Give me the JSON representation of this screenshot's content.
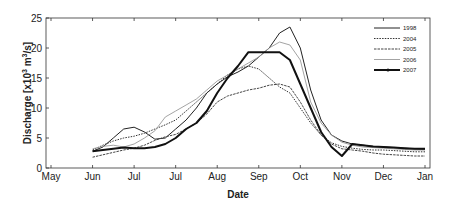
{
  "chart_data": {
    "type": "line",
    "title": "",
    "xlabel": "Date",
    "ylabel": "Discharge [x10^3 m^3/s]",
    "ylabel_parts": {
      "main": "Discharge [x10",
      "exp1": "3",
      "mid": " m",
      "exp2": "3",
      "end": "/s]"
    },
    "ylim": [
      0,
      25
    ],
    "yticks": [
      "0",
      "5",
      "10",
      "15",
      "20",
      "25"
    ],
    "xticks": [
      "May",
      "Jun",
      "Jul",
      "Jul",
      "Aug",
      "Sep",
      "Oct",
      "Nov",
      "Dec",
      "Jan"
    ],
    "grid": false,
    "legend_position": "upper right",
    "x": [
      0.0,
      0.25,
      0.5,
      0.75,
      1.0,
      1.25,
      1.5,
      1.75,
      2.0,
      2.25,
      2.5,
      2.75,
      3.0,
      3.25,
      3.5,
      3.75,
      4.0,
      4.25,
      4.5,
      4.75,
      5.0,
      5.25,
      5.5,
      5.75,
      6.0,
      6.25,
      6.5,
      6.75,
      7.0,
      7.25,
      7.5,
      7.75,
      8.0
    ],
    "series": [
      {
        "name": "1998",
        "style": "solid-thin",
        "values": [
          2.8,
          3.5,
          5.0,
          6.5,
          6.8,
          6.0,
          4.8,
          5.0,
          6.5,
          8.0,
          10.0,
          12.5,
          14.0,
          15.2,
          16.0,
          17.0,
          18.5,
          20.0,
          22.5,
          23.5,
          20.0,
          13.0,
          8.0,
          5.5,
          4.5,
          4.0,
          3.8,
          3.6,
          3.5,
          3.4,
          3.3,
          3.2,
          3.1
        ]
      },
      {
        "name": "2004",
        "style": "dotted",
        "values": [
          3.0,
          3.8,
          4.5,
          5.0,
          5.3,
          5.8,
          6.5,
          7.2,
          8.0,
          9.5,
          11.0,
          12.5,
          14.0,
          15.5,
          16.5,
          17.0,
          16.5,
          15.0,
          13.5,
          12.5,
          10.0,
          7.5,
          5.5,
          4.2,
          3.6,
          3.3,
          3.1,
          3.0,
          3.0,
          2.9,
          2.8,
          2.7,
          2.7
        ]
      },
      {
        "name": "2005",
        "style": "dashed",
        "values": [
          1.8,
          2.2,
          2.6,
          3.0,
          3.3,
          3.8,
          4.6,
          5.2,
          5.6,
          6.5,
          7.5,
          9.0,
          11.0,
          12.0,
          12.5,
          13.0,
          13.3,
          13.8,
          14.0,
          13.5,
          11.0,
          8.0,
          5.5,
          4.0,
          3.2,
          3.0,
          2.8,
          2.5,
          2.3,
          2.2,
          2.1,
          2.0,
          2.0
        ]
      },
      {
        "name": "2006",
        "style": "light-gray",
        "values": [
          3.2,
          3.6,
          3.8,
          3.5,
          4.0,
          5.0,
          6.2,
          8.5,
          9.5,
          10.5,
          11.5,
          13.0,
          14.5,
          15.5,
          16.5,
          17.5,
          18.5,
          20.0,
          21.0,
          20.5,
          18.0,
          11.0,
          7.5,
          5.5,
          4.3,
          3.8,
          3.5,
          3.4,
          3.3,
          3.2,
          3.1,
          3.0,
          3.0
        ]
      },
      {
        "name": "2007",
        "style": "thick-marker",
        "values": [
          2.8,
          3.0,
          3.2,
          3.4,
          3.3,
          3.3,
          3.5,
          4.0,
          5.0,
          6.5,
          7.5,
          9.5,
          12.5,
          15.0,
          17.0,
          19.3,
          19.3,
          19.3,
          19.3,
          18.0,
          14.0,
          10.0,
          6.0,
          3.5,
          2.0,
          4.0,
          3.8,
          3.6,
          3.5,
          3.4,
          3.3,
          3.2,
          3.2
        ]
      }
    ]
  }
}
